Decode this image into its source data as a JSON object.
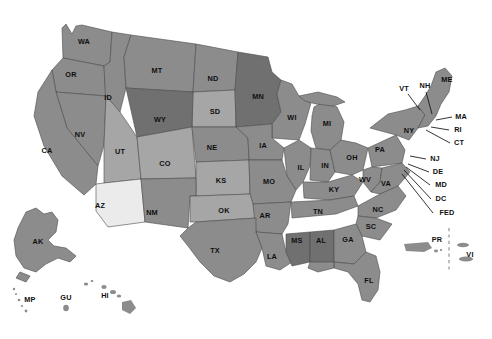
{
  "map": {
    "title": "United States and Territories Map",
    "background_color": "#ffffff",
    "outline_color": "#4b4b4b",
    "label_color": "#0f0f0f",
    "fills": {
      "base": "#8c8c8c",
      "dark": "#707070",
      "light": "#a6a6a6",
      "lighter": "#b5b5b5",
      "highlight": "#ebebeb"
    },
    "divider_color": "#8a8a8a",
    "leader_color": "#111111",
    "states": [
      {
        "code": "WA",
        "x": 84,
        "y": 42,
        "shade": "base"
      },
      {
        "code": "OR",
        "x": 71,
        "y": 75,
        "shade": "base"
      },
      {
        "code": "ID",
        "x": 108,
        "y": 98,
        "shade": "base"
      },
      {
        "code": "MT",
        "x": 157,
        "y": 71,
        "shade": "base"
      },
      {
        "code": "ND",
        "x": 213,
        "y": 79,
        "shade": "base"
      },
      {
        "code": "SD",
        "x": 215,
        "y": 112,
        "shade": "light"
      },
      {
        "code": "MN",
        "x": 258,
        "y": 97,
        "shade": "dark"
      },
      {
        "code": "WI",
        "x": 292,
        "y": 118,
        "shade": "base"
      },
      {
        "code": "MI",
        "x": 327,
        "y": 124,
        "shade": "base"
      },
      {
        "code": "WY",
        "x": 160,
        "y": 120,
        "shade": "dark"
      },
      {
        "code": "NV",
        "x": 80,
        "y": 135,
        "shade": "base"
      },
      {
        "code": "CA",
        "x": 47,
        "y": 151,
        "shade": "base"
      },
      {
        "code": "UT",
        "x": 120,
        "y": 152,
        "shade": "light"
      },
      {
        "code": "CO",
        "x": 165,
        "y": 164,
        "shade": "light"
      },
      {
        "code": "NE",
        "x": 212,
        "y": 148,
        "shade": "base"
      },
      {
        "code": "IA",
        "x": 263,
        "y": 146,
        "shade": "base"
      },
      {
        "code": "IL",
        "x": 301,
        "y": 168,
        "shade": "base"
      },
      {
        "code": "IN",
        "x": 325,
        "y": 166,
        "shade": "base"
      },
      {
        "code": "OH",
        "x": 352,
        "y": 158,
        "shade": "base"
      },
      {
        "code": "PA",
        "x": 380,
        "y": 150,
        "shade": "base"
      },
      {
        "code": "NY",
        "x": 409,
        "y": 131,
        "shade": "base"
      },
      {
        "code": "KS",
        "x": 221,
        "y": 181,
        "shade": "light"
      },
      {
        "code": "MO",
        "x": 269,
        "y": 182,
        "shade": "base"
      },
      {
        "code": "KY",
        "x": 334,
        "y": 190,
        "shade": "base"
      },
      {
        "code": "WV",
        "x": 365,
        "y": 180,
        "shade": "base"
      },
      {
        "code": "VA",
        "x": 386,
        "y": 184,
        "shade": "base"
      },
      {
        "code": "AZ",
        "x": 100,
        "y": 206,
        "shade": "highlight"
      },
      {
        "code": "NM",
        "x": 152,
        "y": 213,
        "shade": "base"
      },
      {
        "code": "OK",
        "x": 224,
        "y": 211,
        "shade": "light"
      },
      {
        "code": "AR",
        "x": 265,
        "y": 216,
        "shade": "base"
      },
      {
        "code": "TN",
        "x": 318,
        "y": 212,
        "shade": "base"
      },
      {
        "code": "NC",
        "x": 378,
        "y": 210,
        "shade": "base"
      },
      {
        "code": "SC",
        "x": 371,
        "y": 227,
        "shade": "base"
      },
      {
        "code": "TX",
        "x": 215,
        "y": 251,
        "shade": "base"
      },
      {
        "code": "LA",
        "x": 272,
        "y": 257,
        "shade": "base"
      },
      {
        "code": "MS",
        "x": 297,
        "y": 241,
        "shade": "dark"
      },
      {
        "code": "AL",
        "x": 321,
        "y": 241,
        "shade": "dark"
      },
      {
        "code": "GA",
        "x": 348,
        "y": 240,
        "shade": "base"
      },
      {
        "code": "FL",
        "x": 369,
        "y": 281,
        "shade": "base"
      },
      {
        "code": "AK",
        "x": 38,
        "y": 242,
        "shade": "base"
      },
      {
        "code": "HI",
        "x": 105,
        "y": 296,
        "shade": "base"
      }
    ],
    "leader_labels": [
      {
        "code": "VT",
        "x": 404,
        "y": 89
      },
      {
        "code": "NH",
        "x": 425,
        "y": 86
      },
      {
        "code": "ME",
        "x": 447,
        "y": 80
      },
      {
        "code": "MA",
        "x": 461,
        "y": 117
      },
      {
        "code": "RI",
        "x": 458,
        "y": 130
      },
      {
        "code": "CT",
        "x": 459,
        "y": 143
      },
      {
        "code": "NJ",
        "x": 435,
        "y": 159
      },
      {
        "code": "DE",
        "x": 438,
        "y": 172
      },
      {
        "code": "MD",
        "x": 441,
        "y": 185
      },
      {
        "code": "DC",
        "x": 441,
        "y": 199
      },
      {
        "code": "FED",
        "x": 447,
        "y": 213
      }
    ],
    "territories": [
      {
        "code": "PR",
        "x": 437,
        "y": 240
      },
      {
        "code": "VI",
        "x": 470,
        "y": 255
      },
      {
        "code": "MP",
        "x": 30,
        "y": 300
      },
      {
        "code": "GU",
        "x": 66,
        "y": 298
      }
    ]
  }
}
